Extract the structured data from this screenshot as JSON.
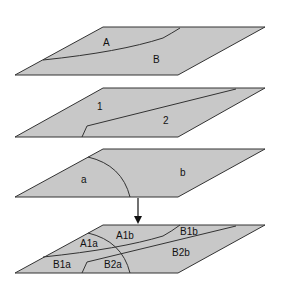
{
  "diagram": {
    "layers": [
      {
        "name": "layer-1",
        "regions": [
          "A",
          "B"
        ]
      },
      {
        "name": "layer-2",
        "regions": [
          "1",
          "2"
        ]
      },
      {
        "name": "layer-3",
        "regions": [
          "a",
          "b"
        ]
      },
      {
        "name": "layer-overlay",
        "regions": [
          "A1a",
          "A1b",
          "B1b",
          "B1a",
          "B2a",
          "B2b"
        ]
      }
    ],
    "labels": {
      "A": "A",
      "B": "B",
      "one": "1",
      "two": "2",
      "a": "a",
      "b": "b",
      "A1a": "A1a",
      "A1b": "A1b",
      "B1b": "B1b",
      "B1a": "B1a",
      "B2a": "B2a",
      "B2b": "B2b"
    },
    "arrow": "down-arrow",
    "colors": {
      "fill": "#c8c8c8",
      "stroke": "#333333",
      "background": "#ffffff"
    }
  }
}
